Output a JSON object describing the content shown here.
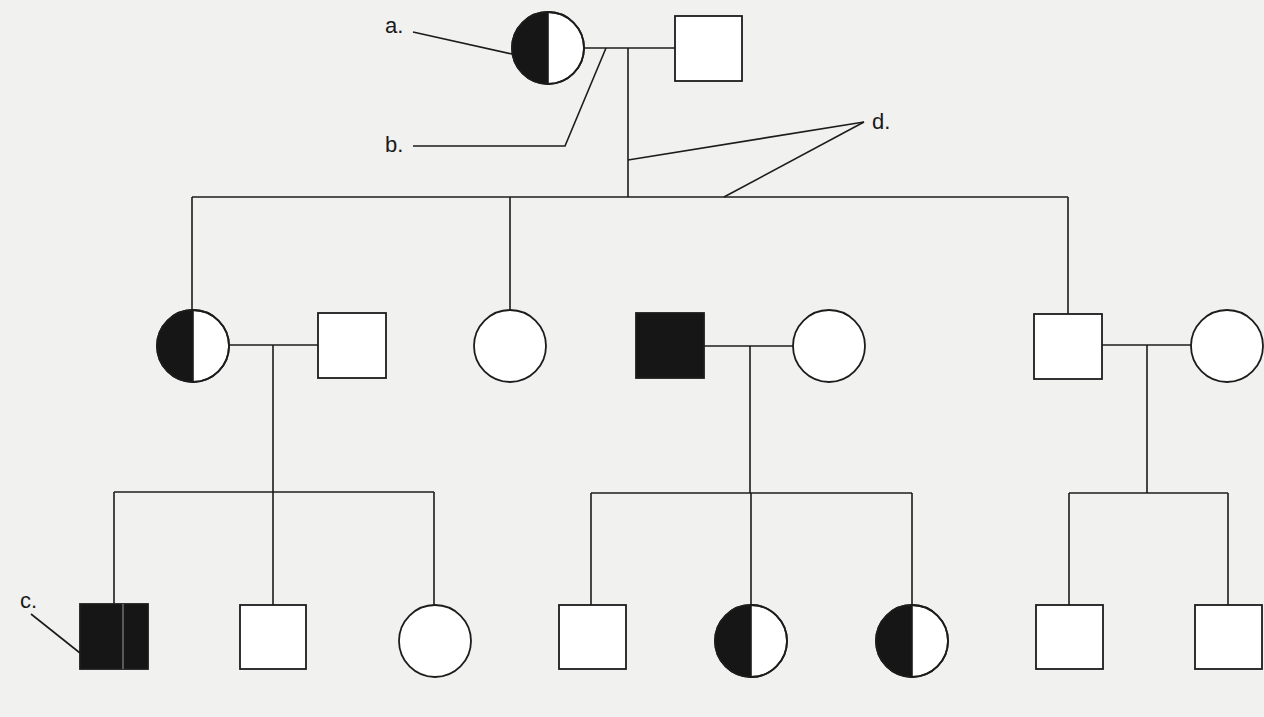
{
  "diagram": {
    "type": "pedigree",
    "generations": 3,
    "colors": {
      "background": "#f1f1f0",
      "line": "#1c1c1c",
      "affected_fill": "#161616",
      "unaffected_fill": "#ffffff"
    },
    "legend_symbols": {
      "square": "male",
      "circle": "female",
      "filled": "affected",
      "half-filled": "carrier"
    },
    "labels": {
      "a": "a.",
      "b": "b.",
      "c": "c.",
      "d": "d."
    },
    "individuals": [
      {
        "id": "I-1",
        "generation": 1,
        "sex": "female",
        "status": "carrier",
        "label": "a."
      },
      {
        "id": "I-2",
        "generation": 1,
        "sex": "male",
        "status": "unaffected"
      },
      {
        "id": "II-1",
        "generation": 2,
        "sex": "female",
        "status": "carrier"
      },
      {
        "id": "II-2",
        "generation": 2,
        "sex": "male",
        "status": "unaffected",
        "note": "married in"
      },
      {
        "id": "II-3",
        "generation": 2,
        "sex": "female",
        "status": "unaffected"
      },
      {
        "id": "II-4",
        "generation": 2,
        "sex": "male",
        "status": "affected",
        "note": "married in"
      },
      {
        "id": "II-5",
        "generation": 2,
        "sex": "female",
        "status": "unaffected"
      },
      {
        "id": "II-6",
        "generation": 2,
        "sex": "male",
        "status": "unaffected"
      },
      {
        "id": "II-7",
        "generation": 2,
        "sex": "female",
        "status": "unaffected",
        "note": "married in"
      },
      {
        "id": "III-1",
        "generation": 3,
        "sex": "male",
        "status": "affected",
        "label": "c."
      },
      {
        "id": "III-2",
        "generation": 3,
        "sex": "male",
        "status": "unaffected"
      },
      {
        "id": "III-3",
        "generation": 3,
        "sex": "female",
        "status": "unaffected"
      },
      {
        "id": "III-4",
        "generation": 3,
        "sex": "male",
        "status": "unaffected"
      },
      {
        "id": "III-5",
        "generation": 3,
        "sex": "female",
        "status": "carrier"
      },
      {
        "id": "III-6",
        "generation": 3,
        "sex": "female",
        "status": "carrier"
      },
      {
        "id": "III-7",
        "generation": 3,
        "sex": "male",
        "status": "unaffected"
      },
      {
        "id": "III-8",
        "generation": 3,
        "sex": "male",
        "status": "unaffected"
      }
    ],
    "matings": [
      {
        "partners": [
          "I-1",
          "I-2"
        ],
        "children": [
          "II-1",
          "II-3",
          "II-6"
        ],
        "label": "b."
      },
      {
        "partners": [
          "II-1",
          "II-2"
        ],
        "children": [
          "III-1",
          "III-2",
          "III-3"
        ]
      },
      {
        "partners": [
          "II-4",
          "II-5"
        ],
        "children": [
          "III-4",
          "III-5",
          "III-6"
        ]
      },
      {
        "partners": [
          "II-6",
          "II-7"
        ],
        "children": [
          "III-7",
          "III-8"
        ]
      }
    ],
    "annotations": [
      {
        "label": "a.",
        "points_to": "I-1 (carrier female)"
      },
      {
        "label": "b.",
        "points_to": "mating line between I-1 and I-2"
      },
      {
        "label": "c.",
        "points_to": "III-1 (affected male)"
      },
      {
        "label": "d.",
        "points_to": "descent line and sibship line of generation II"
      }
    ]
  }
}
